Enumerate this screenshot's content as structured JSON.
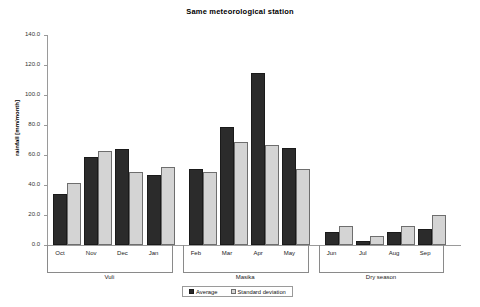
{
  "chart_data": {
    "type": "bar",
    "title": "Same meteorological station",
    "xlabel": "",
    "ylabel": "rainfall [mm/month]",
    "ylim": [
      0,
      140
    ],
    "ytick_step": 20,
    "ytick_labels": [
      "0.0",
      "20.0",
      "40.0",
      "60.0",
      "80.0",
      "100.0",
      "120.0",
      "140.0"
    ],
    "ytick_values": [
      0,
      20,
      40,
      60,
      80,
      100,
      120,
      140
    ],
    "grid": false,
    "legend_position": "bottom-center",
    "categories": [
      "Oct",
      "Nov",
      "Dec",
      "Jan",
      "Feb",
      "Mar",
      "Apr",
      "May",
      "Jun",
      "Jul",
      "Aug",
      "Sep"
    ],
    "series": [
      {
        "name": "Average",
        "color": "#2b2b2b",
        "values": [
          34,
          59,
          64,
          47,
          50.5,
          79,
          114.5,
          65,
          8.5,
          3,
          8.5,
          11
        ]
      },
      {
        "name": "Standard deviation",
        "color": "#d4d4d4",
        "values": [
          41.5,
          63,
          49,
          52,
          48.5,
          69,
          66.5,
          50.5,
          13,
          6,
          13,
          20
        ]
      }
    ],
    "groups": [
      {
        "label": "Vuli",
        "categories": [
          "Oct",
          "Nov",
          "Dec",
          "Jan"
        ]
      },
      {
        "label": "Masika",
        "categories": [
          "Feb",
          "Mar",
          "Apr",
          "May"
        ]
      },
      {
        "label": "Dry season",
        "categories": [
          "Jun",
          "Jul",
          "Aug",
          "Sep"
        ]
      }
    ]
  },
  "legend": {
    "items": [
      {
        "label": "Average",
        "swatch": "avg"
      },
      {
        "label": "Standard deviation",
        "swatch": "std"
      }
    ]
  }
}
